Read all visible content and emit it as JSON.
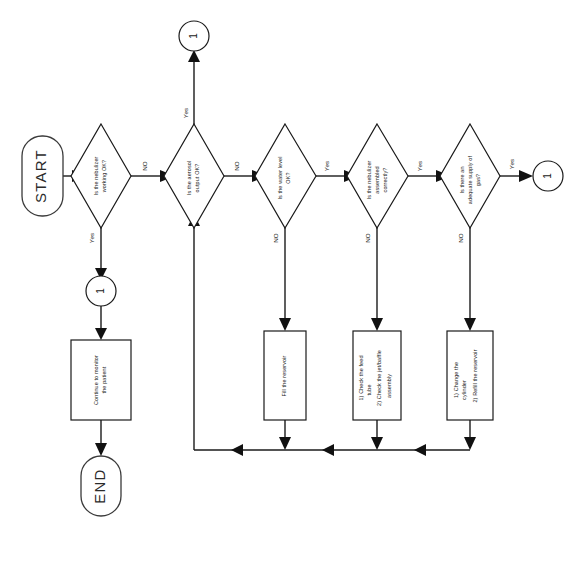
{
  "diagram": {
    "orientation": "rotated-90-ccw",
    "background_color": "#ffffff",
    "line_color": "#1a1a1a",
    "text_color": "#1a1a1a"
  },
  "terminals": {
    "start": {
      "label": "START"
    },
    "end": {
      "label": "END"
    }
  },
  "connectors": {
    "top": {
      "label": "1"
    },
    "left": {
      "label": "1"
    },
    "right": {
      "label": "1"
    }
  },
  "decisions": [
    {
      "id": "d1",
      "line1": "Is the nebulizer",
      "line2": "working OK?",
      "yes_label": "Yes",
      "no_label": "NO"
    },
    {
      "id": "d2",
      "line1": "Is the aerosol",
      "line2": "output OK?",
      "yes_label": "Yes",
      "no_label": "NO"
    },
    {
      "id": "d3",
      "line1": "Is the water level",
      "line2": "OK?",
      "yes_label": "Yes",
      "no_label": "NO"
    },
    {
      "id": "d4",
      "line1": "Is the nebulizer",
      "line2": "assembled",
      "line3": "correctly?",
      "yes_label": "Yes",
      "no_label": "NO"
    },
    {
      "id": "d5",
      "line1": "Is there an",
      "line2": "adequate supply of",
      "line3": "gas?",
      "yes_label": "Yes",
      "no_label": "NO"
    }
  ],
  "processes": [
    {
      "id": "p_monitor",
      "line1": "Continue to monitor",
      "line2": "the patient"
    },
    {
      "id": "p_fill",
      "line1": "Fill the reservoir"
    },
    {
      "id": "p_check",
      "line1": "1) Check the feed",
      "line2": "tube",
      "line3": "2) Check the jet/baffle",
      "line4": "assembly"
    },
    {
      "id": "p_gas",
      "line1": "1) Change the",
      "line2": "cylinder",
      "line3": "2) Refill the reservoir"
    }
  ]
}
